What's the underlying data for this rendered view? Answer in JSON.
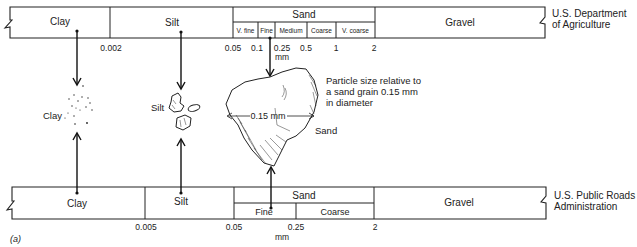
{
  "figure_label": "(a)",
  "usda": {
    "org_line1": "U.S. Department",
    "org_line2": "of Agriculture",
    "classes": {
      "clay": "Clay",
      "silt": "Silt",
      "sand": "Sand",
      "gravel": "Gravel"
    },
    "sand_subclasses": [
      "V. fine",
      "Fine",
      "Medium",
      "Coarse",
      "V. coarse"
    ],
    "boundaries": [
      "0.002",
      "0.05",
      "0.1",
      "0.25",
      "0.5",
      "1",
      "2"
    ],
    "unit": "mm"
  },
  "pra": {
    "org_line1": "U.S. Public Roads",
    "org_line2": "Administration",
    "classes": {
      "clay": "Clay",
      "silt": "Silt",
      "sand": "Sand",
      "gravel": "Gravel"
    },
    "sand_subclasses": [
      "Fine",
      "Coarse"
    ],
    "boundaries": [
      "0.005",
      "0.05",
      "0.25",
      "2"
    ],
    "unit": "mm"
  },
  "particles": {
    "clay_label": "Clay",
    "silt_label": "Silt",
    "sand_label": "Sand",
    "sand_dimension": "0.15 mm",
    "caption_line1": "Particle size relative to",
    "caption_line2": "a sand grain 0.15 mm",
    "caption_line3": "in diameter"
  },
  "colors": {
    "line": "#222222",
    "background": "#ffffff"
  }
}
